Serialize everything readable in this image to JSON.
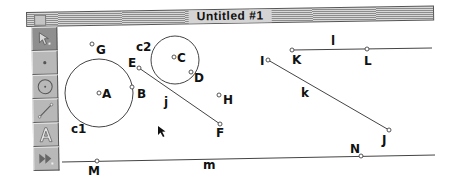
{
  "window": {
    "title": "Untitled #1"
  },
  "toolbox": {
    "tools": [
      {
        "name": "selection-arrow",
        "icon": "arrow-icon",
        "selected": true
      },
      {
        "name": "point",
        "icon": "point-icon",
        "selected": false
      },
      {
        "name": "compass",
        "icon": "circle-icon",
        "selected": false
      },
      {
        "name": "straightedge",
        "icon": "segment-icon",
        "selected": false
      },
      {
        "name": "text",
        "icon": "text-a-icon",
        "selected": false
      },
      {
        "name": "custom",
        "icon": "custom-tool-icon",
        "selected": false
      }
    ]
  },
  "sketch": {
    "points": [
      {
        "label": "A"
      },
      {
        "label": "B"
      },
      {
        "label": "C"
      },
      {
        "label": "D"
      },
      {
        "label": "E"
      },
      {
        "label": "F"
      },
      {
        "label": "G"
      },
      {
        "label": "H"
      },
      {
        "label": "I"
      },
      {
        "label": "J"
      },
      {
        "label": "K"
      },
      {
        "label": "L"
      },
      {
        "label": "M"
      },
      {
        "label": "N"
      }
    ],
    "circles": [
      {
        "label": "c1"
      },
      {
        "label": "c2"
      }
    ],
    "lines": [
      {
        "label": "j"
      },
      {
        "label": "k"
      },
      {
        "label": "l"
      },
      {
        "label": "m"
      }
    ]
  }
}
